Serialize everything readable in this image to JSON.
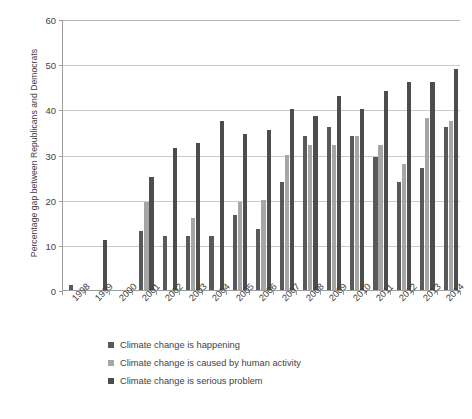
{
  "chart_data": {
    "type": "bar",
    "title": "",
    "subtitle": "",
    "xlabel": "",
    "ylabel": "Percentage gap between Republicans and Democrats",
    "ylim": [
      0,
      60
    ],
    "yticks": [
      0,
      10,
      20,
      30,
      40,
      50,
      60
    ],
    "grid": true,
    "legend_position": "bottom-left",
    "categories": [
      "1998",
      "1999",
      "2000",
      "2001",
      "2002",
      "2003",
      "2004",
      "2005",
      "2006",
      "2007",
      "2008",
      "2009",
      "2010",
      "2011",
      "2012",
      "2013",
      "2014"
    ],
    "series": [
      {
        "name": "Climate change is happening",
        "color": "#595959",
        "values": [
          1,
          null,
          null,
          13,
          12,
          12,
          12,
          16.5,
          13.5,
          24,
          34,
          36,
          34,
          29.5,
          24,
          27,
          36
        ]
      },
      {
        "name": "Climate change is caused by human activity",
        "color": "#a6a6a6",
        "values": [
          null,
          null,
          null,
          19.5,
          null,
          16,
          null,
          19.5,
          20,
          30,
          32,
          32,
          34,
          32,
          28,
          38,
          37.5
        ]
      },
      {
        "name": "Climate change is serious problem",
        "color": "#4d4d4d",
        "values": [
          null,
          11,
          null,
          25,
          31.5,
          32.5,
          37.5,
          34.5,
          35.5,
          40,
          38.5,
          43,
          40,
          44,
          46,
          46,
          49
        ]
      }
    ]
  },
  "legend": {
    "items": [
      {
        "label": "Climate change is happening",
        "color": "#595959"
      },
      {
        "label": "Climate change is caused by human activity",
        "color": "#a6a6a6"
      },
      {
        "label": "Climate change is serious problem",
        "color": "#4d4d4d"
      }
    ]
  },
  "axis": {
    "y_title": "Percentage gap between Republicans and Democrats"
  }
}
